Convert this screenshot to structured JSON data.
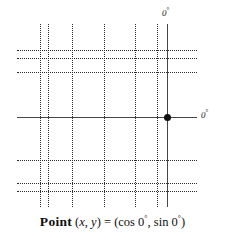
{
  "figure": {
    "type": "trigonometric-reference-grid",
    "labels": {
      "top_angle": "0",
      "top_angle_degree_symbol": "°",
      "right_angle": "0",
      "right_angle_degree_symbol": "°"
    },
    "caption": {
      "lead": "Point",
      "open_coord": "(",
      "x_var": "x",
      "coord_comma": ",",
      "y_var": "y",
      "close_coord": ")",
      "equals": "=",
      "open_value": "(",
      "cos_term": "cos 0",
      "cos_degree": "°",
      "value_comma": ",",
      "sin_term": "sin 0",
      "sin_degree": "°",
      "close_value": ")",
      "full_text": "Point (x, y) = (cos 0°, sin 0°)"
    },
    "colors": {
      "grid": "#2b2b2b",
      "axis": "#464646",
      "point": "#111111",
      "text": "#101010",
      "background": "#ffffff"
    },
    "geometry": {
      "vertical_grid_x": [
        40,
        48,
        72,
        104,
        135,
        157
      ],
      "horizontal_grid_y": [
        50,
        58,
        72,
        160,
        183,
        191
      ],
      "axis_vertical_x": 167,
      "axis_vertical_top": 24,
      "axis_vertical_bottom": 207,
      "axis_horizontal_y": 117,
      "axis_horizontal_left": 17,
      "axis_horizontal_right": 197,
      "grid_top": 24,
      "grid_bottom": 207,
      "grid_left": 17,
      "grid_right": 197,
      "point_x": 167,
      "point_y": 117
    }
  }
}
